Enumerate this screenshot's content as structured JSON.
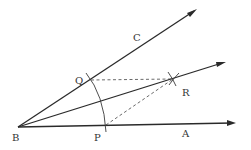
{
  "diagram": {
    "title": "",
    "points": {
      "B": {
        "label": "B",
        "x": 18,
        "y": 127,
        "label_x": 12,
        "label_y": 141
      },
      "P": {
        "label": "P",
        "x": 106,
        "y": 125,
        "label_x": 94,
        "label_y": 141
      },
      "Q": {
        "label": "Q",
        "x": 91,
        "y": 80,
        "label_x": 75,
        "label_y": 84
      },
      "R": {
        "label": "R",
        "x": 173,
        "y": 79,
        "label_x": 182,
        "label_y": 96
      },
      "A": {
        "label": "A",
        "label_x": 182,
        "label_y": 137
      },
      "C": {
        "label": "C",
        "label_x": 133,
        "label_y": 41
      }
    },
    "rays": [
      {
        "name": "ray-BC",
        "from": "B",
        "to": [
          196,
          10
        ]
      },
      {
        "name": "ray-BR",
        "from": "B",
        "to": [
          225,
          62
        ]
      },
      {
        "name": "ray-BA",
        "from": "B",
        "to": [
          235,
          124
        ]
      }
    ],
    "dashed_segments": [
      {
        "name": "segment-QR",
        "from": "Q",
        "to": "R"
      },
      {
        "name": "segment-PR",
        "from": "P",
        "to": "R"
      }
    ],
    "arcs": [
      {
        "name": "arc-PQ",
        "center": "B",
        "radius": 88
      }
    ],
    "colors": {
      "stroke": "#2a2a2a",
      "label": "#333333",
      "background": "#ffffff"
    }
  }
}
